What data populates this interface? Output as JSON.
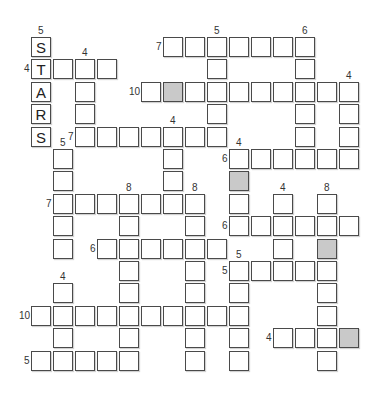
{
  "puzzle": {
    "type": "crossword-fill-in",
    "colors": {
      "cell_border": "#4a4a4a",
      "cell_fill": "#ffffff",
      "shaded_fill": "#c9c9c9",
      "label": "#333333"
    },
    "grid": {
      "origin_x": 31,
      "origin_y": 37,
      "pitch_x": 22,
      "pitch_y": 22.4
    },
    "entries": [
      {
        "id": "d-stars",
        "dir": "down",
        "label": "5",
        "row": 0,
        "col": 0,
        "len": 5,
        "letters": [
          "S",
          "T",
          "A",
          "R",
          "S"
        ]
      },
      {
        "id": "a-7-top",
        "dir": "across",
        "label": "7",
        "row": 0,
        "col": 6,
        "len": 7
      },
      {
        "id": "d-5-c8",
        "dir": "down",
        "label": "5",
        "row": 0,
        "col": 8,
        "len": 5
      },
      {
        "id": "d-6-c12",
        "dir": "down",
        "label": "6",
        "row": 0,
        "col": 12,
        "len": 6
      },
      {
        "id": "a-4-r1",
        "dir": "across",
        "label": "4",
        "row": 1,
        "col": 0,
        "len": 4
      },
      {
        "id": "d-4-c2",
        "dir": "down",
        "label": "4",
        "row": 1,
        "col": 2,
        "len": 4
      },
      {
        "id": "a-10-r2",
        "dir": "across",
        "label": "10",
        "row": 2,
        "col": 5,
        "len": 10,
        "shaded": [
          1
        ]
      },
      {
        "id": "d-4-c14",
        "dir": "down",
        "label": "4",
        "row": 2,
        "col": 14,
        "len": 4
      },
      {
        "id": "a-7-r4",
        "dir": "across",
        "label": "7",
        "row": 4,
        "col": 2,
        "len": 7
      },
      {
        "id": "d-4-c6",
        "dir": "down",
        "label": "4",
        "row": 4,
        "col": 6,
        "len": 4
      },
      {
        "id": "d-5-c1",
        "dir": "down",
        "label": "5",
        "row": 5,
        "col": 1,
        "len": 5
      },
      {
        "id": "a-6-r5",
        "dir": "across",
        "label": "6",
        "row": 5,
        "col": 9,
        "len": 6
      },
      {
        "id": "d-4-c9",
        "dir": "down",
        "label": "4",
        "row": 5,
        "col": 9,
        "len": 4,
        "shaded": [
          1
        ]
      },
      {
        "id": "a-7-r7",
        "dir": "across",
        "label": "7",
        "row": 7,
        "col": 1,
        "len": 7
      },
      {
        "id": "d-8-c4",
        "dir": "down",
        "label": "8",
        "row": 7,
        "col": 4,
        "len": 8
      },
      {
        "id": "d-8-c7",
        "dir": "down",
        "label": "8",
        "row": 7,
        "col": 7,
        "len": 8
      },
      {
        "id": "d-4-c11",
        "dir": "down",
        "label": "4",
        "row": 7,
        "col": 11,
        "len": 4
      },
      {
        "id": "d-8-c13",
        "dir": "down",
        "label": "8",
        "row": 7,
        "col": 13,
        "len": 8,
        "shaded": [
          2
        ]
      },
      {
        "id": "a-6-r8",
        "dir": "across",
        "label": "6",
        "row": 8,
        "col": 9,
        "len": 6
      },
      {
        "id": "a-6-r9",
        "dir": "across",
        "label": "6",
        "row": 9,
        "col": 3,
        "len": 6
      },
      {
        "id": "a-5-r10",
        "dir": "across",
        "label": "5",
        "row": 10,
        "col": 9,
        "len": 5
      },
      {
        "id": "d-5-c9",
        "dir": "down",
        "label": "5",
        "row": 10,
        "col": 9,
        "len": 5
      },
      {
        "id": "d-4-c1",
        "dir": "down",
        "label": "4",
        "row": 11,
        "col": 1,
        "len": 4
      },
      {
        "id": "a-10-r12",
        "dir": "across",
        "label": "10",
        "row": 12,
        "col": 0,
        "len": 10
      },
      {
        "id": "a-4-r13",
        "dir": "across",
        "label": "4",
        "row": 13,
        "col": 11,
        "len": 4,
        "shaded": [
          3
        ]
      },
      {
        "id": "a-5-r14",
        "dir": "across",
        "label": "5",
        "row": 14,
        "col": 0,
        "len": 5
      }
    ]
  }
}
